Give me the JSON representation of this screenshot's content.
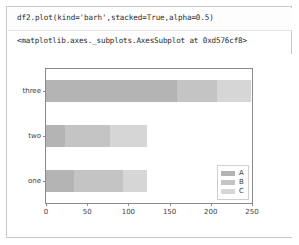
{
  "cell": {
    "code": "df2.plot(kind='barh',stacked=True,alpha=0.5)",
    "output_repr": "<matplotlib.axes._subplots.AxesSubplot at 0xd576cf8>"
  },
  "chart_data": {
    "type": "bar",
    "orientation": "horizontal",
    "stacked": true,
    "alpha": 0.5,
    "title": "",
    "xlabel": "",
    "ylabel": "",
    "categories": [
      "one",
      "two",
      "three"
    ],
    "xticks": [
      0,
      50,
      100,
      150,
      200,
      250
    ],
    "xlim": [
      0,
      250
    ],
    "grid": false,
    "legend": {
      "position": "lower right",
      "entries": [
        "A",
        "B",
        "C"
      ]
    },
    "series": [
      {
        "name": "A",
        "values": [
          34,
          23,
          159
        ],
        "color": "#b4b4b4"
      },
      {
        "name": "B",
        "values": [
          60,
          55,
          48
        ],
        "color": "#c4c4c4"
      },
      {
        "name": "C",
        "values": [
          28,
          44,
          42
        ],
        "color": "#d6d6d6"
      }
    ],
    "totals": [
      122,
      122,
      249
    ]
  },
  "colors": {
    "axes_frame": "#8a8a8a",
    "tick_label": "#3d3d3d",
    "cell_border": "#c9c9c9",
    "background": "#ffffff"
  }
}
